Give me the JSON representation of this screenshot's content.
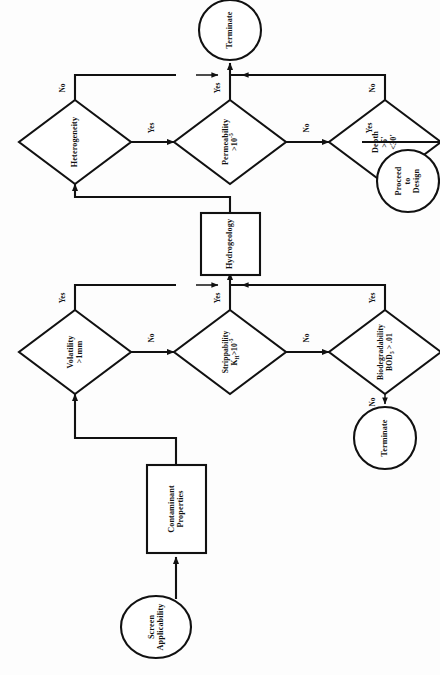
{
  "diagram": {
    "orientation": "rotated-90-ccw",
    "ink_color": "#111111",
    "background_color": "#fdfdfd"
  },
  "nodes": {
    "screen_applicability": {
      "type": "terminator",
      "line1": "Screen",
      "line2": "Applicability"
    },
    "contaminant_properties": {
      "type": "process",
      "line1": "Contaminant",
      "line2": "Properties"
    },
    "volatility": {
      "type": "decision",
      "line1": "Volatility",
      "line2": ">1mm"
    },
    "strippability": {
      "type": "decision",
      "line1": "Strippability",
      "line2": "K",
      "sub2": "H",
      "line2b": ">10",
      "sup2": "-5"
    },
    "biodegradability": {
      "type": "decision",
      "line1": "Biodegradability",
      "line2": "BOD",
      "sub2": "5",
      "line2b": " > .01"
    },
    "terminate_bottom": {
      "type": "terminator",
      "line1": "Terminate"
    },
    "hydrogeology": {
      "type": "process",
      "line1": "Hydrogeology"
    },
    "heterogeneity": {
      "type": "decision",
      "line1": "Heterogeneity"
    },
    "permeability": {
      "type": "decision",
      "line1": "Permeability",
      "line2": ">10",
      "sup2": "-5"
    },
    "depth": {
      "type": "decision",
      "line1": "Depth",
      "line2": ">5'",
      "line3": "<30'"
    },
    "terminate_top": {
      "type": "terminator",
      "line1": "Terminate"
    },
    "proceed_to_design": {
      "type": "terminator",
      "line1": "Proceed",
      "line2": "to",
      "line3": "Design"
    }
  },
  "edge_labels": {
    "volatility_yes": "Yes",
    "volatility_no": "No",
    "strippability_yes": "Yes",
    "strippability_no": "No",
    "biodegradability_yes": "Yes",
    "biodegradability_no": "No",
    "heterogeneity_no": "No",
    "heterogeneity_yes": "Yes",
    "permeability_yes": "Yes",
    "permeability_no": "No",
    "depth_no": "No",
    "depth_yes": "Yes"
  }
}
